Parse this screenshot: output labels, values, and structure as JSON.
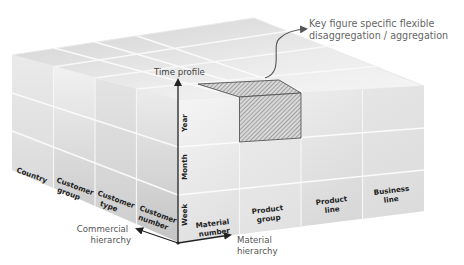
{
  "diagram": {
    "annotation": {
      "line1": "Key figure specific flexible",
      "line2": "disaggregation / aggregation"
    },
    "axes": {
      "time": {
        "label": "Time profile",
        "levels": [
          "Week",
          "Month",
          "Year"
        ]
      },
      "commercial": {
        "label_line1": "Commercial",
        "label_line2": "hierarchy",
        "levels": [
          {
            "line1": "Country",
            "line2": ""
          },
          {
            "line1": "Customer",
            "line2": "group"
          },
          {
            "line1": "Customer",
            "line2": "type"
          },
          {
            "line1": "Customer",
            "line2": "number"
          }
        ]
      },
      "material": {
        "label_line1": "Material",
        "label_line2": "hierarchy",
        "levels": [
          {
            "line1": "Material",
            "line2": "number"
          },
          {
            "line1": "Product",
            "line2": "group"
          },
          {
            "line1": "Product",
            "line2": "line"
          },
          {
            "line1": "Business",
            "line2": "line"
          }
        ]
      }
    },
    "highlighted_cell": {
      "material": "Product group",
      "time": "Year"
    },
    "colors": {
      "cell_light": "#f2f2f2",
      "cell_dark": "#bdbdbd",
      "edge": "#e6e6e6",
      "axis": "#222222",
      "hatch": "#555555"
    }
  }
}
